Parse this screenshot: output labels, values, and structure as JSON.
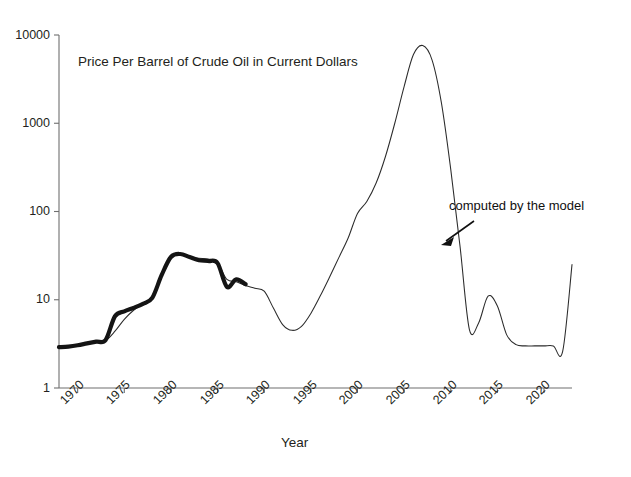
{
  "chart_data": {
    "type": "line",
    "title": "Price Per Barrel of Crude Oil in Current Dollars",
    "xlabel": "Year",
    "ylabel": "",
    "yscale": "log",
    "ylim": [
      1,
      10000
    ],
    "xlim": [
      1968,
      2023
    ],
    "grid": false,
    "legend": "none",
    "y_ticks": [
      "10000",
      "1000",
      "100",
      "10",
      "1"
    ],
    "y_tick_values": [
      10000,
      1000,
      100,
      10,
      1
    ],
    "x_ticks": [
      "1970",
      "1975",
      "1980",
      "1985",
      "1990",
      "1995",
      "2000",
      "2005",
      "2010",
      "2015",
      "2020"
    ],
    "x_tick_values": [
      1970,
      1975,
      1980,
      1985,
      1990,
      1995,
      2000,
      2005,
      2010,
      2015,
      2020
    ],
    "annotations": [
      {
        "name": "computed-by-the-model",
        "text": "computed by the model",
        "text_x": 2007.9,
        "text_y": 180,
        "arrow_from_x": 2010.4,
        "arrow_from_y": 125,
        "arrow_to_x": 2007.0,
        "arrow_to_y": 62
      }
    ],
    "series": [
      {
        "name": "Historical price (observed)",
        "style": "thick-line",
        "color": "#141414",
        "x": [
          1968,
          1969,
          1970,
          1971,
          1972,
          1973,
          1974,
          1975,
          1976,
          1977,
          1978,
          1979,
          1980,
          1981,
          1982,
          1983,
          1984,
          1985,
          1986,
          1987,
          1988
        ],
        "values": [
          2.9,
          2.95,
          3.05,
          3.2,
          3.35,
          3.5,
          6.5,
          7.4,
          8.1,
          9.0,
          10.5,
          19.0,
          30.5,
          33.0,
          30.5,
          28.0,
          27.5,
          26.0,
          14.0,
          17.0,
          15.0
        ]
      },
      {
        "name": "Model computed price",
        "style": "thin-line",
        "color": "#2b2b2b",
        "x": [
          1968,
          1969,
          1970,
          1971,
          1972,
          1973,
          1974,
          1975,
          1976,
          1977,
          1978,
          1979,
          1980,
          1981,
          1982,
          1983,
          1984,
          1985,
          1986,
          1987,
          1988,
          1989,
          1990,
          1991,
          1992,
          1993,
          1994,
          1995,
          1996,
          1997,
          1998,
          1999,
          2000,
          2001,
          2002,
          2003,
          2004,
          2005,
          2006,
          2007,
          2008,
          2009,
          2010,
          2011,
          2012,
          2013,
          2014,
          2015,
          2016,
          2017,
          2018,
          2019,
          2020,
          2021,
          2022,
          2023
        ],
        "values": [
          2.9,
          2.95,
          3.05,
          3.2,
          3.3,
          3.45,
          4.4,
          6.0,
          7.6,
          9.0,
          11.0,
          19.0,
          30.0,
          32.5,
          30.5,
          29.5,
          29.0,
          26.0,
          17.0,
          16.0,
          14.5,
          13.5,
          12.5,
          8.0,
          5.2,
          4.5,
          5.0,
          7.0,
          11.0,
          18.0,
          30.0,
          50.0,
          95.0,
          130.0,
          210.0,
          420.0,
          1000.0,
          2600.0,
          6000.0,
          7600.0,
          5200.0,
          1700.0,
          300.0,
          40.0,
          4.6,
          5.5,
          11.0,
          8.5,
          4.0,
          3.1,
          3.0,
          3.0,
          3.0,
          3.0,
          2.6,
          25.0
        ]
      }
    ]
  },
  "geometry": {
    "plot_left": 59,
    "plot_right": 572,
    "plot_top": 35,
    "plot_bottom": 388
  }
}
